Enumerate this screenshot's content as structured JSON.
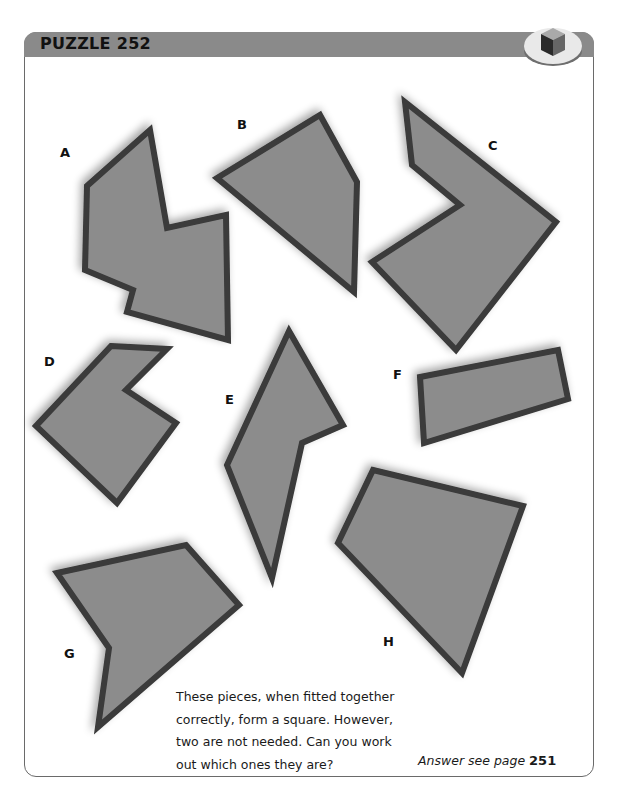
{
  "header": {
    "title": "PUZZLE 252",
    "bar_color": "#8a8a8a",
    "badge_icon": "cube-icon"
  },
  "pieces": [
    {
      "label": "A",
      "label_pos": [
        60,
        145
      ],
      "points": "150,130 87,186 85,270 133,290 127,312 228,340 226,215 167,228"
    },
    {
      "label": "B",
      "label_pos": [
        237,
        117
      ],
      "points": "217,178 320,115 357,182 354,292"
    },
    {
      "label": "C",
      "label_pos": [
        488,
        138
      ],
      "points": "405,102 412,165 460,205 372,262 456,350 556,222"
    },
    {
      "label": "D",
      "label_pos": [
        44,
        354
      ],
      "points": "111,346 167,349 126,390 176,423 117,503 36,426"
    },
    {
      "label": "E",
      "label_pos": [
        225,
        392
      ],
      "points": "289,331 343,425 302,443 272,578 227,465"
    },
    {
      "label": "F",
      "label_pos": [
        393,
        367
      ],
      "points": "420,377 558,350 568,399 424,443"
    },
    {
      "label": "G",
      "label_pos": [
        64,
        646
      ],
      "points": "57,573 186,545 239,605 98,727 109,648"
    },
    {
      "label": "H",
      "label_pos": [
        383,
        634
      ],
      "points": "373,470 523,506 462,673 338,543"
    }
  ],
  "style": {
    "piece_fill": "#8c8c8c",
    "piece_stroke": "#3a3a3a"
  },
  "description": {
    "lines": [
      "These pieces, when fitted together",
      "correctly, form a square. However,",
      "two are not needed. Can you work",
      "out which ones they are?"
    ]
  },
  "answer": {
    "prefix": "Answer see page ",
    "page": "251"
  }
}
